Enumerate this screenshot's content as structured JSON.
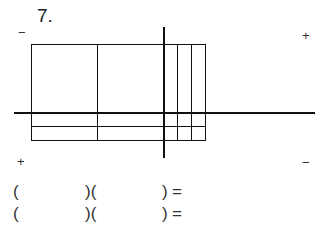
{
  "problem": {
    "number_label": "7."
  },
  "diagram": {
    "type": "area-model-grid",
    "corner_signs": {
      "top_left": "−",
      "top_right": "+",
      "bottom_left": "+",
      "bottom_right": "−"
    },
    "rectangle": {
      "left": 31,
      "top": 44,
      "right": 205,
      "bottom": 140
    },
    "vertical_lines_x": [
      98,
      177,
      191
    ],
    "horizontal_lines_y": [
      127
    ],
    "thick_horizontal_axis": {
      "y": 113,
      "x_start": 14,
      "x_end": 315
    },
    "thick_vertical_axis": {
      "x": 164,
      "y_start": 27,
      "y_end": 157
    }
  },
  "equations": [
    {
      "open_paren": "(",
      "middle": ")(",
      "close": ")",
      "equals": "="
    },
    {
      "open_paren": "(",
      "middle": ")(",
      "close": ")",
      "equals": "="
    }
  ]
}
